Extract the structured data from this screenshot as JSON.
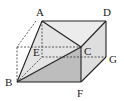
{
  "diagram": {
    "type": "solid-geometry",
    "colors": {
      "stroke": "#222222",
      "shade_light": "#e6e6e6",
      "shade_mid": "#cfcfcf",
      "shade_dark": "#b8b8b8"
    },
    "vertices": [
      {
        "name": "A",
        "label": "A",
        "x": 42,
        "y": 21,
        "lx": 36,
        "ly": 16
      },
      {
        "name": "D",
        "label": "D",
        "x": 106,
        "y": 21,
        "lx": 103,
        "ly": 16
      },
      {
        "name": "C",
        "label": "C",
        "x": 81,
        "y": 47,
        "lx": 84,
        "ly": 55
      },
      {
        "name": "G",
        "label": "G",
        "x": 106,
        "y": 57,
        "lx": 109,
        "ly": 63
      },
      {
        "name": "E",
        "label": "E",
        "x": 42,
        "y": 57,
        "lx": 33,
        "ly": 56
      },
      {
        "name": "B",
        "label": "B",
        "x": 17,
        "y": 82,
        "lx": 5,
        "ly": 86
      },
      {
        "name": "F",
        "label": "F",
        "x": 81,
        "y": 82,
        "lx": 77,
        "ly": 96
      }
    ]
  }
}
